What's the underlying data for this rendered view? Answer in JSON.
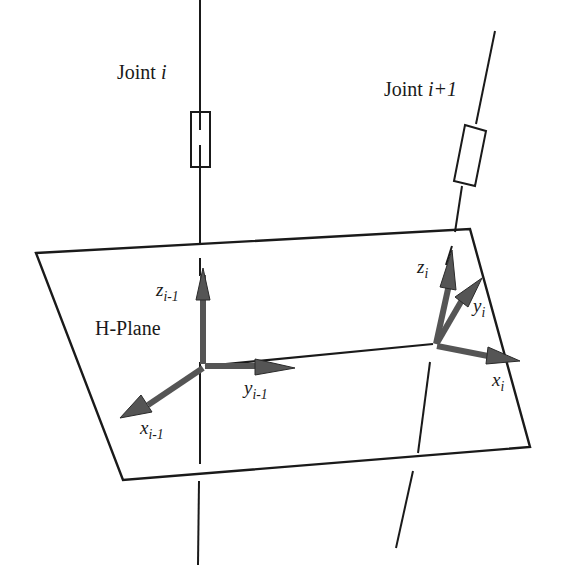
{
  "figure": {
    "type": "robot-kinematics-frame-diagram",
    "plane_label": "H-Plane",
    "joints": [
      {
        "name": "Joint",
        "index": "i"
      },
      {
        "name": "Joint",
        "index": "i+1"
      }
    ],
    "frames": [
      {
        "id": "frame-i-1",
        "axes": [
          {
            "symbol": "z",
            "subscript": "i-1"
          },
          {
            "symbol": "y",
            "subscript": "i-1"
          },
          {
            "symbol": "x",
            "subscript": "i-1"
          }
        ]
      },
      {
        "id": "frame-i",
        "axes": [
          {
            "symbol": "z",
            "subscript": "i"
          },
          {
            "symbol": "y",
            "subscript": "i"
          },
          {
            "symbol": "x",
            "subscript": "i"
          }
        ]
      }
    ],
    "colors": {
      "line": "#1a1a1a",
      "arrow_fill": "#555555",
      "arrow_stroke": "#2a2a2a",
      "background": "#ffffff"
    }
  }
}
